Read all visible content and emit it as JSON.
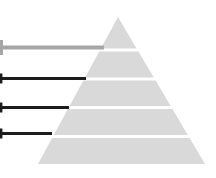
{
  "diagram": {
    "type": "pyramid",
    "background_color": "#ffffff",
    "pyramid": {
      "fill_color": "#d9d9d9",
      "separator_color": "#ffffff",
      "apex": {
        "x": 118,
        "y": 17
      },
      "base": {
        "left_x": 38,
        "right_x": 205,
        "y": 164
      },
      "levels": [
        {
          "name": "level-1",
          "top": 17,
          "bottom": 48.5
        },
        {
          "name": "level-2",
          "top": 51.5,
          "bottom": 77.5
        },
        {
          "name": "level-3",
          "top": 80.5,
          "bottom": 106
        },
        {
          "name": "level-4",
          "top": 109,
          "bottom": 135
        },
        {
          "name": "level-5",
          "top": 138,
          "bottom": 164
        }
      ]
    },
    "leader_lines": [
      {
        "name": "leader-line-1",
        "y": 47.5,
        "x_start": 0,
        "x_end": 104,
        "color": "#a6a6a6",
        "thickness": 4,
        "cap_height": 15,
        "cap_thickness": 3
      },
      {
        "name": "leader-line-2",
        "y": 78.5,
        "x_start": 0,
        "x_end": 86,
        "color": "#1c1c1c",
        "thickness": 3.2,
        "cap_height": 10,
        "cap_thickness": 2.4
      },
      {
        "name": "leader-line-3",
        "y": 107.5,
        "x_start": 0,
        "x_end": 69,
        "color": "#1c1c1c",
        "thickness": 3.2,
        "cap_height": 10,
        "cap_thickness": 2.4
      },
      {
        "name": "leader-line-4",
        "y": 133.5,
        "x_start": 0,
        "x_end": 52,
        "color": "#1c1c1c",
        "thickness": 3.2,
        "cap_height": 10,
        "cap_thickness": 2.4
      }
    ]
  }
}
